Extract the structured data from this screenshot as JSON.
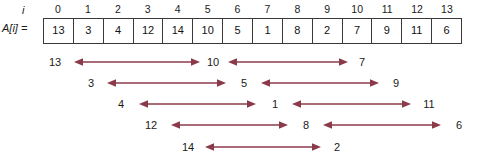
{
  "figure": {
    "labels": {
      "index_label": "i",
      "array_label": "A[i] =",
      "arrow_color": "#8B3A4A",
      "box_border_color": "#3a3a3a"
    },
    "array": {
      "indices": [
        "0",
        "1",
        "2",
        "3",
        "4",
        "5",
        "6",
        "7",
        "8",
        "9",
        "10",
        "11",
        "12",
        "13"
      ],
      "values": [
        "13",
        "3",
        "4",
        "12",
        "14",
        "10",
        "5",
        "1",
        "8",
        "2",
        "7",
        "9",
        "11",
        "6"
      ]
    },
    "arrow_rows": [
      {
        "row": 1,
        "nodes": [
          "13",
          "10",
          "7"
        ],
        "node_x": [
          55,
          213,
          362
        ],
        "arrows": [
          {
            "x1": 74,
            "x2": 200
          },
          {
            "x1": 228,
            "x2": 348
          }
        ]
      },
      {
        "row": 2,
        "nodes": [
          "3",
          "5",
          "9"
        ],
        "node_x": [
          91,
          244,
          396
        ],
        "arrows": [
          {
            "x1": 107,
            "x2": 226
          },
          {
            "x1": 261,
            "x2": 379
          }
        ]
      },
      {
        "row": 3,
        "nodes": [
          "4",
          "1",
          "11"
        ],
        "node_x": [
          121,
          275,
          429
        ],
        "arrows": [
          {
            "x1": 139,
            "x2": 256
          },
          {
            "x1": 292,
            "x2": 411
          }
        ]
      },
      {
        "row": 4,
        "nodes": [
          "12",
          "8",
          "6"
        ],
        "node_x": [
          151,
          306,
          459
        ],
        "arrows": [
          {
            "x1": 171,
            "x2": 288
          },
          {
            "x1": 323,
            "x2": 441
          }
        ]
      },
      {
        "row": 5,
        "nodes": [
          "14",
          "2"
        ],
        "node_x": [
          188,
          337
        ],
        "arrows": [
          {
            "x1": 205,
            "x2": 321
          }
        ]
      }
    ],
    "row_tops": [
      52,
      73,
      94,
      115,
      137
    ]
  },
  "chart_data": {
    "type": "table",
    "title": "",
    "categories": [
      "0",
      "1",
      "2",
      "3",
      "4",
      "5",
      "6",
      "7",
      "8",
      "9",
      "10",
      "11",
      "12",
      "13"
    ],
    "values": [
      13,
      3,
      4,
      12,
      14,
      10,
      5,
      1,
      8,
      2,
      7,
      9,
      11,
      6
    ],
    "xlabel": "i",
    "ylabel": "A[i]",
    "annotations": [
      {
        "row": 1,
        "pairs": [
          [
            "13",
            "10"
          ],
          [
            "10",
            "7"
          ]
        ]
      },
      {
        "row": 2,
        "pairs": [
          [
            "3",
            "5"
          ],
          [
            "5",
            "9"
          ]
        ]
      },
      {
        "row": 3,
        "pairs": [
          [
            "4",
            "1"
          ],
          [
            "1",
            "11"
          ]
        ]
      },
      {
        "row": 4,
        "pairs": [
          [
            "12",
            "8"
          ],
          [
            "8",
            "6"
          ]
        ]
      },
      {
        "row": 5,
        "pairs": [
          [
            "14",
            "2"
          ]
        ]
      }
    ]
  }
}
